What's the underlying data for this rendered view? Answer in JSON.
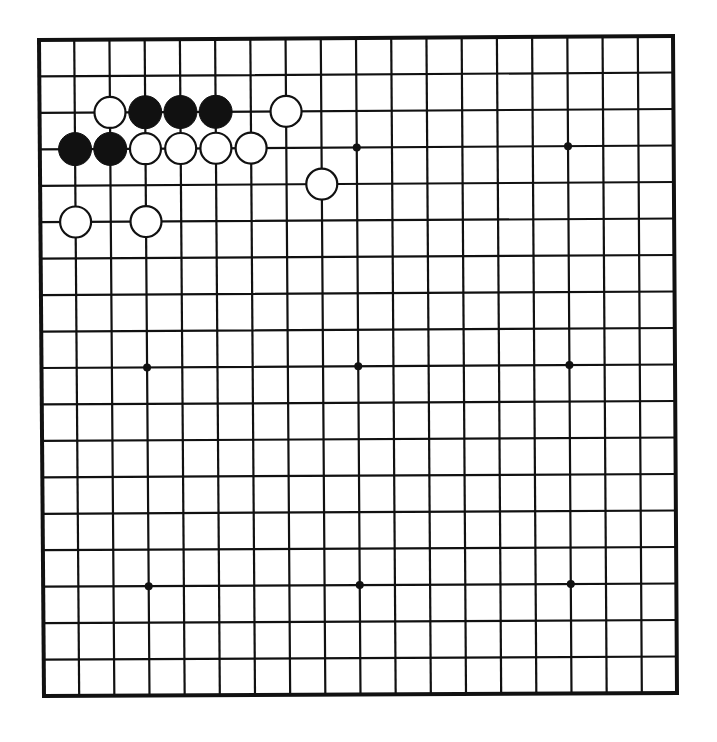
{
  "diagram": {
    "type": "go-board",
    "size": 19,
    "colors": {
      "background": "#ffffff",
      "line": "#111111",
      "black_stone": "#111111",
      "white_stone": "#ffffff",
      "stone_outline": "#111111"
    },
    "hoshi": [
      [
        4,
        4
      ],
      [
        10,
        4
      ],
      [
        16,
        4
      ],
      [
        4,
        10
      ],
      [
        10,
        10
      ],
      [
        16,
        10
      ],
      [
        4,
        16
      ],
      [
        10,
        16
      ],
      [
        16,
        16
      ]
    ],
    "stones": [
      {
        "color": "white",
        "col": 3,
        "row": 3
      },
      {
        "color": "black",
        "col": 4,
        "row": 3
      },
      {
        "color": "black",
        "col": 5,
        "row": 3
      },
      {
        "color": "black",
        "col": 6,
        "row": 3
      },
      {
        "color": "white",
        "col": 8,
        "row": 3
      },
      {
        "color": "black",
        "col": 2,
        "row": 4
      },
      {
        "color": "black",
        "col": 3,
        "row": 4
      },
      {
        "color": "white",
        "col": 4,
        "row": 4
      },
      {
        "color": "white",
        "col": 5,
        "row": 4
      },
      {
        "color": "white",
        "col": 6,
        "row": 4
      },
      {
        "color": "white",
        "col": 7,
        "row": 4
      },
      {
        "color": "white",
        "col": 9,
        "row": 5
      },
      {
        "color": "white",
        "col": 2,
        "row": 6
      },
      {
        "color": "white",
        "col": 4,
        "row": 6
      }
    ]
  }
}
